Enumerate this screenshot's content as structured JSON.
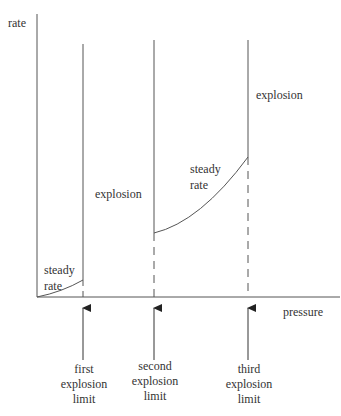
{
  "diagram": {
    "title": "",
    "axes": {
      "y_label": "rate",
      "x_label": "pressure"
    },
    "regions": {
      "low_steady": [
        "steady",
        "rate"
      ],
      "first_explosion": "explosion",
      "mid_steady": [
        "steady",
        "rate"
      ],
      "third_explosion": "explosion"
    },
    "limits": [
      {
        "id": "first",
        "lines": [
          "first",
          "explosion",
          "limit"
        ]
      },
      {
        "id": "second",
        "lines": [
          "second",
          "explosion",
          "limit"
        ]
      },
      {
        "id": "third",
        "lines": [
          "third",
          "explosion",
          "limit"
        ]
      }
    ],
    "colors": {
      "line": "#555555",
      "text": "#333333",
      "background": "#ffffff"
    }
  }
}
